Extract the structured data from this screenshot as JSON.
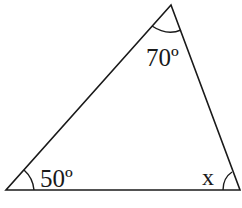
{
  "diagram": {
    "type": "triangle",
    "vertices": {
      "top": [
        171,
        5
      ],
      "bottom_left": [
        6,
        190
      ],
      "bottom_right": [
        240,
        190
      ]
    },
    "angles": {
      "top": {
        "label": "70º",
        "value_deg": 70
      },
      "bottom_left": {
        "label": "50º",
        "value_deg": 50
      },
      "bottom_right": {
        "label": "x",
        "value_deg": null
      }
    },
    "colors": {
      "stroke": "#1a1a1a",
      "background": "#ffffff"
    }
  }
}
